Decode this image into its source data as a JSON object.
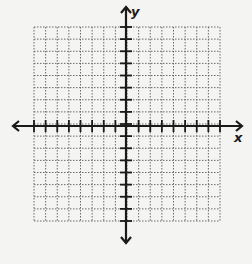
{
  "diagram": {
    "type": "coordinate-plane",
    "x_label": "x",
    "y_label": "y",
    "grid": {
      "cells_x": 16,
      "cells_y": 16,
      "left": 34,
      "top": 27,
      "right": 220,
      "bottom": 221,
      "line_style": "dotted",
      "line_color": "#6a6a6a"
    },
    "axes": {
      "origin_x": 126,
      "origin_y": 126,
      "x_arrow_left": 13,
      "x_arrow_right": 242,
      "y_arrow_top": 7,
      "y_arrow_bottom": 243,
      "ticks_per_side": 8,
      "color": "#1a1a1a"
    },
    "colors": {
      "background": "#f4f4f2",
      "axis": "#1a1a1a",
      "grid": "#6a6a6a"
    }
  }
}
